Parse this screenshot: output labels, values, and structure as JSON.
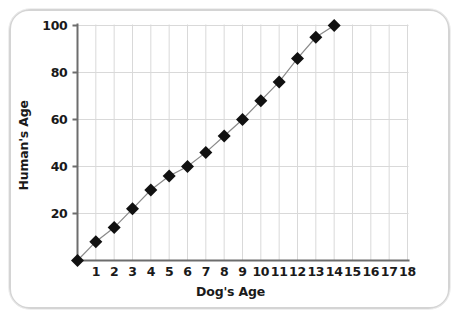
{
  "chart_data": {
    "type": "line",
    "title": "",
    "xlabel": "Dog's Age",
    "ylabel": "Human's Age",
    "xlim": [
      0,
      18
    ],
    "ylim": [
      0,
      100
    ],
    "xticks": [
      1,
      2,
      3,
      4,
      5,
      6,
      7,
      8,
      9,
      10,
      11,
      12,
      13,
      14,
      15,
      16,
      17,
      18
    ],
    "yticks": [
      20,
      40,
      60,
      80,
      100
    ],
    "xtick_labels": [
      "1",
      "2",
      "3",
      "4",
      "5",
      "6",
      "7",
      "8",
      "9",
      "10",
      "11",
      "12",
      "13",
      "14",
      "15",
      "16",
      "17",
      "18"
    ],
    "ytick_labels": [
      "20",
      "40",
      "60",
      "80",
      "100"
    ],
    "grid": true,
    "grid_color": "#d9d9d9",
    "legend": null,
    "marker": "diamond",
    "marker_color": "#111111",
    "line_color": "#8a8a8a",
    "x": [
      0,
      1,
      2,
      3,
      4,
      5,
      6,
      7,
      8,
      9,
      10,
      11,
      12,
      13,
      14
    ],
    "values": [
      0,
      8,
      14,
      22,
      30,
      36,
      40,
      46,
      53,
      60,
      68,
      76,
      86,
      95,
      100
    ],
    "series": [
      {
        "name": "Dog age to human age",
        "x": [
          0,
          1,
          2,
          3,
          4,
          5,
          6,
          7,
          8,
          9,
          10,
          11,
          12,
          13,
          14
        ],
        "values": [
          0,
          8,
          14,
          22,
          30,
          36,
          40,
          46,
          53,
          60,
          68,
          76,
          86,
          95,
          100
        ]
      }
    ]
  },
  "axes": {
    "x_title": "Dog's Age",
    "y_title": "Human's Age"
  },
  "frame": {
    "border_color": "#d4d4d4",
    "background": "#ffffff"
  }
}
